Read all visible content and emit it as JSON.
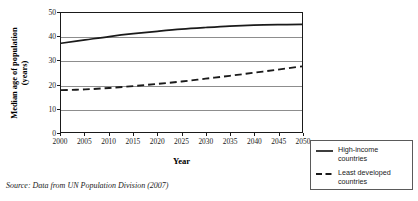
{
  "chart_data": {
    "type": "line",
    "title": "",
    "xlabel": "Year",
    "ylabel_line1": "Median age of population",
    "ylabel_line2": "(years)",
    "x": [
      2000,
      2005,
      2010,
      2015,
      2020,
      2025,
      2030,
      2035,
      2040,
      2045,
      2050
    ],
    "xtick_labels": [
      "2000",
      "2005",
      "2010",
      "2015",
      "2020",
      "2025",
      "2030",
      "2035",
      "2040",
      "2045",
      "2050"
    ],
    "ytick_labels": [
      "0",
      "10",
      "20",
      "30",
      "40",
      "50"
    ],
    "yticks": [
      0,
      10,
      20,
      30,
      40,
      50
    ],
    "xlim": [
      2000,
      2050
    ],
    "ylim": [
      0,
      50
    ],
    "grid": "horizontal",
    "legend_position": "outside-bottom-right",
    "series": [
      {
        "name": "High-income countries",
        "style": "solid",
        "color": "#1a1a1a",
        "values": [
          37.3,
          38.7,
          40.1,
          41.3,
          42.3,
          43.2,
          43.9,
          44.5,
          44.9,
          45.1,
          45.2
        ]
      },
      {
        "name": "Least developed countries",
        "style": "dashed",
        "color": "#1a1a1a",
        "values": [
          17.6,
          17.9,
          18.5,
          19.3,
          20.2,
          21.2,
          22.4,
          23.6,
          24.9,
          26.2,
          27.6
        ]
      }
    ]
  },
  "legend": {
    "items": [
      {
        "label": "High-income countries",
        "style": "solid"
      },
      {
        "label": "Least developed countries",
        "style": "dashed"
      }
    ]
  },
  "source": {
    "text": "Source: Data from UN Population Division (2007)"
  },
  "colors": {
    "axis": "#1a1a1a",
    "gridline": "#8d8d8d",
    "series": "#1a1a1a",
    "background": "#ffffff"
  }
}
